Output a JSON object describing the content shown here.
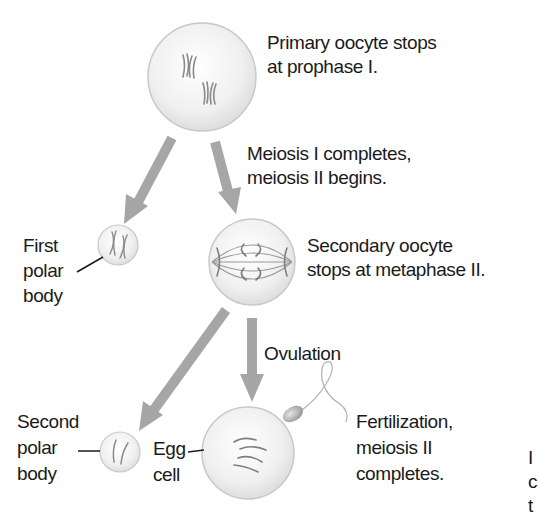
{
  "diagram": {
    "stages": [
      {
        "id": "primary-oocyte",
        "lines": [
          "Primary oocyte stops",
          "at prophase I."
        ]
      },
      {
        "id": "meiosis-transition",
        "lines": [
          "Meiosis I completes,",
          "meiosis II begins."
        ]
      },
      {
        "id": "first-polar-body",
        "lines": [
          "First",
          "polar",
          "body"
        ]
      },
      {
        "id": "secondary-oocyte",
        "lines": [
          "Secondary oocyte",
          "stops at metaphase II."
        ]
      },
      {
        "id": "ovulation",
        "lines": [
          "Ovulation"
        ]
      },
      {
        "id": "second-polar-body",
        "lines": [
          "Second",
          "polar",
          "body"
        ]
      },
      {
        "id": "egg-cell",
        "lines": [
          "Egg",
          "cell"
        ]
      },
      {
        "id": "fertilization",
        "lines": [
          "Fertilization,",
          "meiosis II",
          "completes."
        ]
      }
    ],
    "edge_clipped_text": [
      "I",
      "c",
      "t"
    ],
    "colors": {
      "arrow": "#a6a6a6",
      "cell_fill": "#f2f2f2",
      "cell_stroke": "#c8c8c8",
      "chromosome": "#8a8a8a",
      "text": "#1a1a1a",
      "leader_line": "#1a1a1a"
    }
  }
}
